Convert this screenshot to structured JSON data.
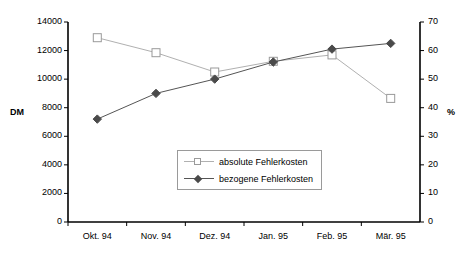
{
  "chart_data": {
    "type": "line",
    "title": "",
    "subtitle": "",
    "xlabel": "",
    "ylabel": "DM",
    "y2label": "%",
    "categories": [
      "Okt. 94",
      "Nov. 94",
      "Dez. 94",
      "Jan. 95",
      "Feb. 95",
      "Mär. 95"
    ],
    "series": [
      {
        "name": "absolute Fehlerkosten",
        "axis": "left",
        "unit": "DM",
        "marker": "open-square",
        "line_color": "#b0b0b0",
        "marker_color": "#9a9a9a",
        "values": [
          12900,
          11850,
          10500,
          11250,
          11700,
          8650
        ]
      },
      {
        "name": "bezogene Fehlerkosten",
        "axis": "right",
        "unit": "%",
        "marker": "filled-diamond",
        "line_color": "#555555",
        "marker_color": "#4a4a4a",
        "values": [
          36,
          45,
          50,
          56,
          60.5,
          62.5
        ]
      }
    ],
    "ylim": [
      0,
      14000
    ],
    "yticks": [
      0,
      2000,
      4000,
      6000,
      8000,
      10000,
      12000,
      14000
    ],
    "ytick_labels": [
      "0",
      "2000",
      "4000",
      "6000",
      "8000",
      "10000",
      "12000",
      "14000"
    ],
    "y2lim": [
      0,
      70
    ],
    "y2ticks": [
      0,
      10,
      20,
      30,
      40,
      50,
      60,
      70
    ],
    "y2tick_labels": [
      "0",
      "10",
      "20",
      "30",
      "40",
      "50",
      "60",
      "70"
    ],
    "grid": false,
    "legend_position": "center"
  },
  "legend": {
    "items": [
      {
        "label": "absolute Fehlerkosten"
      },
      {
        "label": "bezogene Fehlerkosten"
      }
    ]
  },
  "axes": {
    "left_title": "DM",
    "right_title": "%"
  }
}
